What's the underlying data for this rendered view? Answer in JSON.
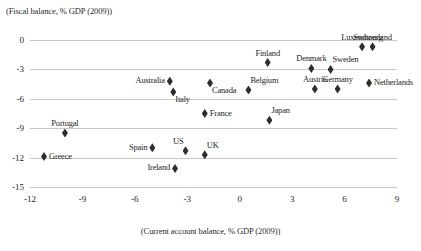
{
  "chart_data": {
    "type": "scatter",
    "title": "",
    "ylabel": "(Fiscal balance, % GDP (2009))",
    "xlabel": "(Current account balance, % GDP (2009))",
    "xlim": [
      -12,
      9
    ],
    "ylim": [
      -15,
      0
    ],
    "xticks": [
      "-12",
      "-9",
      "-6",
      "-3",
      "0",
      "3",
      "6",
      "9"
    ],
    "yticks": [
      "0",
      "-3",
      "-6",
      "-9",
      "-12",
      "-15"
    ],
    "grid": true,
    "legend": "none",
    "marker_color": "#2e2e2e",
    "gridline_color": "#c8c8c8",
    "points": [
      {
        "label": "Greece",
        "x": -11.2,
        "y": -11.9,
        "label_pos": "right"
      },
      {
        "label": "Portugal",
        "x": -10.0,
        "y": -9.5,
        "label_pos": "above"
      },
      {
        "label": "Spain",
        "x": -5.0,
        "y": -11.0,
        "label_pos": "left"
      },
      {
        "label": "Ireland",
        "x": -3.7,
        "y": -13.1,
        "label_pos": "left"
      },
      {
        "label": "US",
        "x": -3.1,
        "y": -11.3,
        "label_pos": "above-left"
      },
      {
        "label": "UK",
        "x": -2.0,
        "y": -11.7,
        "label_pos": "above-right"
      },
      {
        "label": "Australia",
        "x": -4.0,
        "y": -4.2,
        "label_pos": "left"
      },
      {
        "label": "Italy",
        "x": -3.8,
        "y": -5.3,
        "label_pos": "below-right"
      },
      {
        "label": "Canada",
        "x": -1.7,
        "y": -4.4,
        "label_pos": "below-right"
      },
      {
        "label": "France",
        "x": -2.0,
        "y": -7.5,
        "label_pos": "right"
      },
      {
        "label": "Belgium",
        "x": 0.5,
        "y": -5.1,
        "label_pos": "above-right"
      },
      {
        "label": "Japan",
        "x": 1.7,
        "y": -8.2,
        "label_pos": "above-right"
      },
      {
        "label": "Finland",
        "x": 1.6,
        "y": -2.3,
        "label_pos": "above"
      },
      {
        "label": "Denmark",
        "x": 4.1,
        "y": -2.9,
        "label_pos": "above"
      },
      {
        "label": "Austria",
        "x": 4.3,
        "y": -5.0,
        "label_pos": "above"
      },
      {
        "label": "Sweden",
        "x": 5.2,
        "y": -3.0,
        "label_pos": "above-right"
      },
      {
        "label": "Germany",
        "x": 5.6,
        "y": -5.0,
        "label_pos": "above"
      },
      {
        "label": "Luxembourg",
        "x": 7.0,
        "y": -0.7,
        "label_pos": "above"
      },
      {
        "label": "Switzerland",
        "x": 7.6,
        "y": -0.7,
        "label_pos": "above"
      },
      {
        "label": "Netherlands",
        "x": 7.4,
        "y": -4.4,
        "label_pos": "right"
      }
    ]
  }
}
